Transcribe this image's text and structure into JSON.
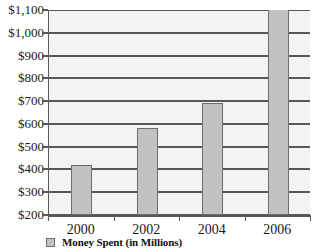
{
  "chart_data": {
    "type": "bar",
    "title": "",
    "xlabel": "",
    "ylabel": "",
    "categories": [
      "2000",
      "2002",
      "2004",
      "2006"
    ],
    "values": [
      420,
      580,
      690,
      1150
    ],
    "series": [
      {
        "name": "Money Spent (in Millions)",
        "values": [
          420,
          580,
          690,
          1150
        ]
      }
    ],
    "ylim": [
      200,
      1100
    ],
    "ytick_values": [
      200,
      300,
      400,
      500,
      600,
      700,
      800,
      900,
      1000,
      1100
    ],
    "ytick_labels": [
      "$200",
      "$300",
      "$400",
      "$500",
      "$600",
      "$700",
      "$800",
      "$900",
      "$1,000",
      "$1,100"
    ],
    "grid": true,
    "legend_position": "bottom-left"
  },
  "legend": {
    "entries": [
      {
        "label": "Money Spent (in Millions)",
        "swatch_color": "#c2c2c2"
      }
    ]
  },
  "colors": {
    "bar_fill": "#c2c2c2",
    "bar_border": "#6e6e6e",
    "plot_background": "#f3f3f3",
    "gridline": "#58585a",
    "axis": "#58585a",
    "text": "#1a1a1a"
  }
}
